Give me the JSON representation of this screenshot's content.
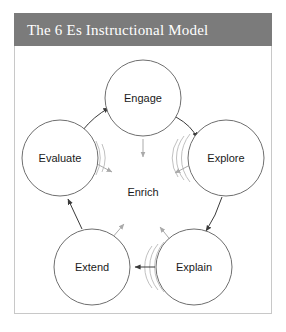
{
  "header": {
    "title": "The 6 Es Instructional Model"
  },
  "colors": {
    "title_bar": "#7b7b7b",
    "title_text": "#ffffff",
    "frame_border": "#c8c8c8",
    "circle_stroke": "#6f6f6f",
    "echo_stroke": "#b9b9b9",
    "arrow_outer": "#3a3a3a",
    "arrow_inner": "#aaaaaa",
    "background": "#ffffff",
    "label_text": "#1a1a1a"
  },
  "diagram": {
    "type": "cycle-diagram",
    "center": {
      "label": "Enrich"
    },
    "nodes": [
      {
        "id": "engage",
        "label": "Engage",
        "cx": 129,
        "cy": 52,
        "r": 38
      },
      {
        "id": "explore",
        "label": "Explore",
        "cx": 212,
        "cy": 112,
        "r": 38
      },
      {
        "id": "explain",
        "label": "Explain",
        "cx": 180,
        "cy": 221,
        "r": 38
      },
      {
        "id": "extend",
        "label": "Extend",
        "cx": 78,
        "cy": 221,
        "r": 38
      },
      {
        "id": "evaluate",
        "label": "Evaluate",
        "cx": 46,
        "cy": 112,
        "r": 38
      }
    ],
    "outer_arrows": [
      {
        "from": "engage",
        "to": "explore"
      },
      {
        "from": "explore",
        "to": "explain"
      },
      {
        "from": "explain",
        "to": "extend"
      },
      {
        "from": "extend",
        "to": "evaluate"
      },
      {
        "from": "evaluate",
        "to": "engage"
      }
    ],
    "inner_arrows": [
      {
        "from": "engage",
        "to": "center"
      },
      {
        "from": "explore",
        "to": "center"
      },
      {
        "from": "explain",
        "to": "center"
      },
      {
        "from": "extend",
        "to": "center"
      },
      {
        "from": "evaluate",
        "to": "center"
      }
    ]
  }
}
